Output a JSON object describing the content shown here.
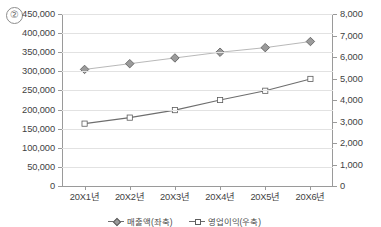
{
  "figure": {
    "marker_label": "②"
  },
  "axes": {
    "left": {
      "ticks": [
        "450,000",
        "400,000",
        "350,000",
        "300,000",
        "250,000",
        "200,000",
        "150,000",
        "100,000",
        "50,000",
        "0"
      ],
      "min": 0,
      "max": 450000,
      "step": 50000
    },
    "right": {
      "ticks": [
        "8,000",
        "7,000",
        "6,000",
        "5,000",
        "4,000",
        "3,000",
        "2,000",
        "1,000",
        "0"
      ],
      "min": 0,
      "max": 8000,
      "step": 1000
    },
    "x": {
      "ticks": [
        "20X1년",
        "20X2년",
        "20X3년",
        "20X4년",
        "20X5년",
        "20X6년"
      ]
    }
  },
  "legend": {
    "items": [
      {
        "label": "매출액(좌축)",
        "marker": "diamond"
      },
      {
        "label": "영업이익(우축)",
        "marker": "square"
      }
    ]
  },
  "chart_data": {
    "type": "line",
    "title": "",
    "subtitle": "",
    "xlabel": "",
    "ylabel": "",
    "grid": true,
    "legend_position": "bottom",
    "categories": [
      "20X1년",
      "20X2년",
      "20X3년",
      "20X4년",
      "20X5년",
      "20X6년"
    ],
    "series": [
      {
        "name": "매출액(좌축)",
        "axis": "left",
        "marker": "diamond",
        "color": "#9b9b9b",
        "line_color": "#b0b0b0",
        "ylim": [
          0,
          450000
        ],
        "values": [
          305000,
          320000,
          335000,
          350000,
          362000,
          378000
        ]
      },
      {
        "name": "영업이익(우축)",
        "axis": "right",
        "marker": "square",
        "color": "#ffffff",
        "line_color": "#6e6e6e",
        "ylim": [
          0,
          8000
        ],
        "values": [
          2900,
          3180,
          3530,
          4000,
          4430,
          4980
        ]
      }
    ]
  }
}
